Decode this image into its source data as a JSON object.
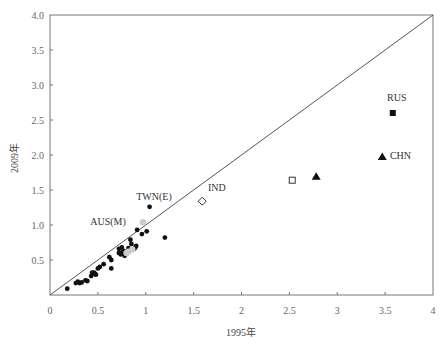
{
  "chart_data": {
    "type": "scatter",
    "title": "",
    "xlabel": "1995年",
    "ylabel": "2009年",
    "xlim": [
      0,
      4
    ],
    "ylim": [
      0,
      4
    ],
    "x_ticks": [
      "0",
      "0.5",
      "1",
      "1.5",
      "2",
      "2.5",
      "3",
      "3.5",
      "4"
    ],
    "y_ticks": [
      "0.5",
      "1.0",
      "1.5",
      "2.0",
      "2.5",
      "3.0",
      "3.5",
      "4.0"
    ],
    "grid": false,
    "reference_line": {
      "type": "diagonal",
      "from": [
        0,
        0
      ],
      "to": [
        4,
        4
      ]
    },
    "series": [
      {
        "name": "other economies",
        "marker": "filled-circle",
        "color": "#111111",
        "points": [
          [
            0.18,
            0.09
          ],
          [
            0.27,
            0.17
          ],
          [
            0.29,
            0.19
          ],
          [
            0.31,
            0.17
          ],
          [
            0.33,
            0.18
          ],
          [
            0.37,
            0.21
          ],
          [
            0.39,
            0.2
          ],
          [
            0.43,
            0.27
          ],
          [
            0.44,
            0.32
          ],
          [
            0.46,
            0.32
          ],
          [
            0.47,
            0.3
          ],
          [
            0.48,
            0.29
          ],
          [
            0.5,
            0.38
          ],
          [
            0.52,
            0.4
          ],
          [
            0.56,
            0.44
          ],
          [
            0.62,
            0.54
          ],
          [
            0.64,
            0.5
          ],
          [
            0.64,
            0.38
          ],
          [
            0.72,
            0.66
          ],
          [
            0.72,
            0.6
          ],
          [
            0.74,
            0.58
          ],
          [
            0.75,
            0.68
          ],
          [
            0.76,
            0.62
          ],
          [
            0.77,
            0.63
          ],
          [
            0.78,
            0.56
          ],
          [
            0.82,
            0.67
          ],
          [
            0.84,
            0.79
          ],
          [
            0.85,
            0.73
          ],
          [
            0.88,
            0.66
          ],
          [
            0.89,
            0.68
          ],
          [
            0.9,
            0.7
          ],
          [
            0.91,
            0.93
          ],
          [
            0.96,
            0.87
          ],
          [
            1.01,
            0.91
          ],
          [
            1.2,
            0.82
          ]
        ]
      },
      {
        "name": "other economies (grey)",
        "marker": "grey-circle",
        "color": "#cccccc",
        "points": [
          [
            0.82,
            0.62
          ],
          [
            0.86,
            0.65
          ],
          [
            0.97,
            1.04
          ],
          [
            0.8,
            0.6
          ]
        ]
      },
      {
        "name": "TWN(E)",
        "marker": "filled-circle",
        "color": "#111111",
        "points": [
          [
            1.04,
            1.26
          ]
        ],
        "label": "TWN(E)"
      },
      {
        "name": "AUS(M)",
        "marker": "label-only",
        "color": "#111111",
        "points": [],
        "label": "AUS(M)"
      },
      {
        "name": "IND",
        "marker": "open-diamond",
        "color": "#333333",
        "points": [
          [
            1.59,
            1.34
          ]
        ],
        "label": "IND"
      },
      {
        "name": "open square",
        "marker": "open-square",
        "color": "#333333",
        "points": [
          [
            2.53,
            1.64
          ]
        ]
      },
      {
        "name": "triangle",
        "marker": "filled-triangle",
        "color": "#111111",
        "points": [
          [
            2.78,
            1.69
          ]
        ]
      },
      {
        "name": "CHN",
        "marker": "filled-triangle",
        "color": "#111111",
        "points": [
          [
            3.47,
            1.97
          ]
        ],
        "label": "CHN"
      },
      {
        "name": "RUS",
        "marker": "filled-square",
        "color": "#111111",
        "points": [
          [
            3.58,
            2.6
          ]
        ],
        "label": "RUS"
      }
    ],
    "annotations": [
      {
        "text": "TWN(E)",
        "x": 0.9,
        "y": 1.36
      },
      {
        "text": "AUS(M)",
        "x": 0.42,
        "y": 1.0
      },
      {
        "text": "IND",
        "x": 1.65,
        "y": 1.48
      },
      {
        "text": "RUS",
        "x": 3.52,
        "y": 2.77
      },
      {
        "text": "CHN",
        "x": 3.55,
        "y": 1.95
      }
    ]
  }
}
